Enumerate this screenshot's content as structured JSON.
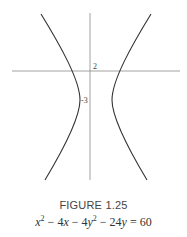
{
  "figure": {
    "label": "FIGURE 1.25",
    "equation": {
      "text": "x^2 - 4x - 4y^2 - 24y = 60",
      "parts": [
        "x",
        "2",
        " − 4",
        "x",
        " − 4",
        "y",
        "2",
        " − 24",
        "y",
        " = 60"
      ]
    }
  },
  "plot": {
    "type": "hyperbola",
    "center": [
      2,
      -3
    ],
    "tick_labels": {
      "x_axis": "2",
      "y_axis": "-3"
    },
    "axis_color": "#8a8a8a",
    "curve_color": "#333333"
  }
}
